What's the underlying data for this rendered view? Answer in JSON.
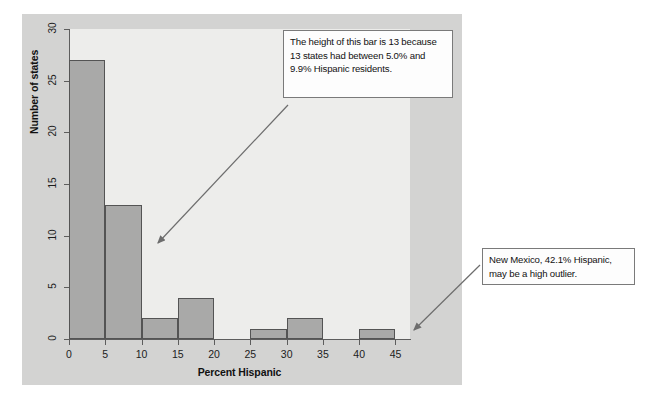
{
  "chart_data": {
    "type": "bar",
    "title": "",
    "xlabel": "Percent Hispanic",
    "ylabel": "Number of states",
    "categories": [
      "0-5",
      "5-10",
      "10-15",
      "15-20",
      "20-25",
      "25-30",
      "30-35",
      "35-40",
      "40-45"
    ],
    "bin_edges": [
      0,
      5,
      10,
      15,
      20,
      25,
      30,
      35,
      40,
      45
    ],
    "values": [
      27,
      13,
      2,
      4,
      0,
      1,
      2,
      0,
      1
    ],
    "xlim": [
      0,
      47
    ],
    "ylim": [
      0,
      30
    ],
    "x_ticks": [
      "0",
      "5",
      "10",
      "15",
      "20",
      "25",
      "30",
      "35",
      "40",
      "45"
    ],
    "x_tick_values": [
      0,
      5,
      10,
      15,
      20,
      25,
      30,
      35,
      40,
      45
    ],
    "y_ticks": [
      "0",
      "5",
      "10",
      "15",
      "20",
      "25",
      "30"
    ],
    "y_tick_values": [
      0,
      5,
      10,
      15,
      20,
      25,
      30
    ],
    "grid": false,
    "legend": "none",
    "bar_color": "#a9a9a8",
    "bar_edge_color": "#545454",
    "plot_background": "#ededeb",
    "panel_background": "#d3d3d2",
    "annotations": [
      {
        "id": "bar-height-note",
        "text": "The height of this bar is 13 because 13 states had between 5.0% and 9.9% Hispanic residents.",
        "points_to_bin": "5-10",
        "points_to_value": 13
      },
      {
        "id": "outlier-note",
        "text": "New Mexico, 42.1% Hispanic, may be a high outlier.",
        "points_to_bin": "40-45",
        "points_to_value": 1
      }
    ]
  }
}
